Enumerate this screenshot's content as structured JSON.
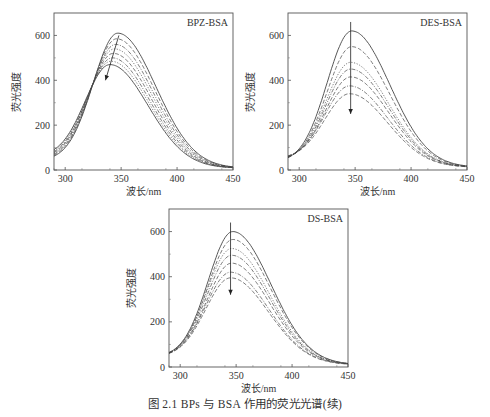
{
  "caption": "图 2.1   BPs 与 BSA 作用的荧光光谱(续)",
  "chart_data": [
    {
      "type": "line",
      "title": "BPZ-BSA",
      "xlabel": "波长/nm",
      "ylabel": "荧光强度",
      "xlim": [
        290,
        450
      ],
      "ylim": [
        0,
        700
      ],
      "xticks": [
        300,
        350,
        400,
        450
      ],
      "yticks": [
        0,
        200,
        400,
        600
      ],
      "grid": false,
      "annotation": "arrow indicating decreasing intensity with blue shift",
      "series": [
        {
          "name": "c0",
          "peak_x": 347,
          "peak_y": 610,
          "start_y": 42,
          "end_y": 8,
          "style": "solid"
        },
        {
          "name": "c1",
          "peak_x": 346,
          "peak_y": 585,
          "start_y": 45,
          "end_y": 8,
          "style": "dash"
        },
        {
          "name": "c2",
          "peak_x": 345,
          "peak_y": 560,
          "start_y": 48,
          "end_y": 8,
          "style": "dashdot"
        },
        {
          "name": "c3",
          "peak_x": 344,
          "peak_y": 540,
          "start_y": 50,
          "end_y": 8,
          "style": "dot"
        },
        {
          "name": "c4",
          "peak_x": 343,
          "peak_y": 520,
          "start_y": 52,
          "end_y": 8,
          "style": "dash"
        },
        {
          "name": "c5",
          "peak_x": 342,
          "peak_y": 500,
          "start_y": 55,
          "end_y": 8,
          "style": "dashdot"
        },
        {
          "name": "c6",
          "peak_x": 341,
          "peak_y": 485,
          "start_y": 58,
          "end_y": 8,
          "style": "dot"
        },
        {
          "name": "c7",
          "peak_x": 340,
          "peak_y": 470,
          "start_y": 60,
          "end_y": 8,
          "style": "solid"
        }
      ],
      "arrow": {
        "from": [
          348,
          600
        ],
        "to": [
          336,
          400
        ]
      }
    },
    {
      "type": "line",
      "title": "DES-BSA",
      "xlabel": "波长/nm",
      "ylabel": "荧光强度",
      "xlim": [
        290,
        450
      ],
      "ylim": [
        0,
        700
      ],
      "xticks": [
        300,
        350,
        400,
        450
      ],
      "yticks": [
        0,
        200,
        400,
        600
      ],
      "grid": false,
      "series": [
        {
          "name": "c0",
          "peak_x": 347,
          "peak_y": 620,
          "start_y": 35,
          "end_y": 12,
          "style": "solid"
        },
        {
          "name": "c1",
          "peak_x": 347,
          "peak_y": 550,
          "start_y": 38,
          "end_y": 12,
          "style": "dash"
        },
        {
          "name": "c2",
          "peak_x": 346,
          "peak_y": 480,
          "start_y": 40,
          "end_y": 12,
          "style": "dot"
        },
        {
          "name": "c3",
          "peak_x": 346,
          "peak_y": 450,
          "start_y": 42,
          "end_y": 12,
          "style": "dashdot"
        },
        {
          "name": "c4",
          "peak_x": 346,
          "peak_y": 415,
          "start_y": 45,
          "end_y": 12,
          "style": "dash"
        },
        {
          "name": "c5",
          "peak_x": 345,
          "peak_y": 375,
          "start_y": 48,
          "end_y": 12,
          "style": "dashdot"
        },
        {
          "name": "c6",
          "peak_x": 345,
          "peak_y": 340,
          "start_y": 50,
          "end_y": 12,
          "style": "dash"
        }
      ],
      "arrow": {
        "from": [
          346,
          660
        ],
        "to": [
          346,
          250
        ]
      }
    },
    {
      "type": "line",
      "title": "DS-BSA",
      "xlabel": "波长/nm",
      "ylabel": "荧光强度",
      "xlim": [
        290,
        450
      ],
      "ylim": [
        0,
        700
      ],
      "xticks": [
        300,
        350,
        400,
        450
      ],
      "yticks": [
        0,
        200,
        400,
        600
      ],
      "grid": false,
      "series": [
        {
          "name": "c0",
          "peak_x": 347,
          "peak_y": 600,
          "start_y": 45,
          "end_y": 10,
          "style": "solid"
        },
        {
          "name": "c1",
          "peak_x": 347,
          "peak_y": 565,
          "start_y": 45,
          "end_y": 10,
          "style": "dash"
        },
        {
          "name": "c2",
          "peak_x": 346,
          "peak_y": 525,
          "start_y": 45,
          "end_y": 10,
          "style": "dot"
        },
        {
          "name": "c3",
          "peak_x": 346,
          "peak_y": 495,
          "start_y": 45,
          "end_y": 10,
          "style": "dashdot"
        },
        {
          "name": "c4",
          "peak_x": 346,
          "peak_y": 460,
          "start_y": 45,
          "end_y": 10,
          "style": "dash"
        },
        {
          "name": "c5",
          "peak_x": 345,
          "peak_y": 420,
          "start_y": 45,
          "end_y": 10,
          "style": "dashdot"
        },
        {
          "name": "c6",
          "peak_x": 345,
          "peak_y": 395,
          "start_y": 45,
          "end_y": 10,
          "style": "dash"
        }
      ],
      "arrow": {
        "from": [
          345,
          640
        ],
        "to": [
          345,
          320
        ]
      }
    }
  ]
}
